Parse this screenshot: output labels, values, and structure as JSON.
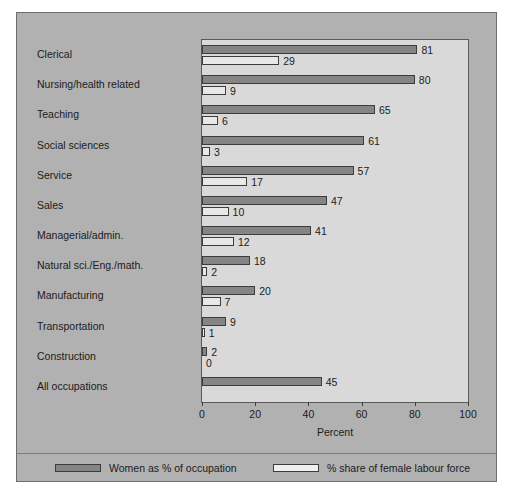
{
  "chart_data": {
    "type": "bar",
    "orientation": "horizontal",
    "title": "",
    "xlabel": "Percent",
    "ylabel": "",
    "xlim": [
      0,
      100
    ],
    "xticks": [
      0,
      20,
      40,
      60,
      80,
      100
    ],
    "grid": false,
    "legend_position": "bottom",
    "categories": [
      "Clerical",
      "Nursing/health related",
      "Teaching",
      "Social sciences",
      "Service",
      "Sales",
      "Managerial/admin.",
      "Natural sci./Eng./math.",
      "Manufacturing",
      "Transportation",
      "Construction",
      "All occupations"
    ],
    "series": [
      {
        "name": "Women as % of occupation",
        "color": "#858585",
        "values": [
          81,
          80,
          65,
          61,
          57,
          47,
          41,
          18,
          20,
          9,
          2,
          45
        ],
        "labels": [
          "81",
          "80",
          "65",
          "61",
          "57",
          "47",
          "41",
          "18",
          "20",
          "9",
          "2",
          "45"
        ]
      },
      {
        "name": "% share of female labour force",
        "color": "#e8e8e8",
        "values": [
          29,
          9,
          6,
          3,
          17,
          10,
          12,
          2,
          7,
          1,
          0,
          null
        ],
        "labels": [
          "29",
          "9",
          "6",
          "3",
          "17",
          "10",
          "12",
          "2",
          "7",
          "1",
          "0",
          ""
        ]
      }
    ]
  },
  "legend": {
    "entries": [
      {
        "label": "Women as % of occupation",
        "swatch": "dark"
      },
      {
        "label": "% share of female labour force",
        "swatch": "light"
      }
    ]
  }
}
